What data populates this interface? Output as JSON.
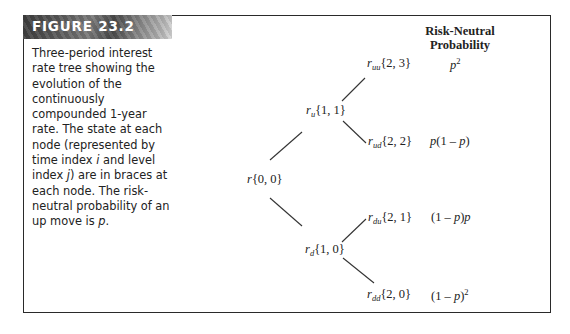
{
  "figure": {
    "label": "FIGURE 23.2",
    "caption_parts": [
      {
        "text": "Three-period interest rate tree showing the evolution of the continuously compounded 1-year rate. The state at each node (represented by time index ",
        "italic": false
      },
      {
        "text": "i",
        "italic": true
      },
      {
        "text": " and level index ",
        "italic": false
      },
      {
        "text": "j",
        "italic": true
      },
      {
        "text": ") are in braces at each node. The risk-neutral probability of an up move is ",
        "italic": false
      },
      {
        "text": "p",
        "italic": true
      },
      {
        "text": ".",
        "italic": false
      }
    ],
    "column_header_line1": "Risk-Neutral",
    "column_header_line2": "Probability"
  },
  "tree": {
    "nodes": [
      {
        "id": "root",
        "symbol": "r",
        "subscript": "",
        "state": "{0, 0}"
      },
      {
        "id": "u",
        "symbol": "r",
        "subscript": "u",
        "state": "{1, 1}"
      },
      {
        "id": "d",
        "symbol": "r",
        "subscript": "d",
        "state": "{1, 0}"
      },
      {
        "id": "uu",
        "symbol": "r",
        "subscript": "uu",
        "state": "{2, 3}"
      },
      {
        "id": "ud",
        "symbol": "r",
        "subscript": "ud",
        "state": "{2, 2}"
      },
      {
        "id": "du",
        "symbol": "r",
        "subscript": "du",
        "state": "{2, 1}"
      },
      {
        "id": "dd",
        "symbol": "r",
        "subscript": "dd",
        "state": "{2, 0}"
      }
    ],
    "edges": [
      [
        "root",
        "u"
      ],
      [
        "root",
        "d"
      ],
      [
        "u",
        "uu"
      ],
      [
        "u",
        "ud"
      ],
      [
        "d",
        "du"
      ],
      [
        "d",
        "dd"
      ]
    ],
    "probabilities": {
      "uu": {
        "base": "p",
        "exp": "2"
      },
      "ud": {
        "pre": "p(1 – ",
        "var": "p",
        "post": ")"
      },
      "du": {
        "pre": "(1 – ",
        "var": "p",
        "post": ")p"
      },
      "dd": {
        "pre": "(1 – ",
        "var": "p",
        "post": ")",
        "exp": "2"
      }
    }
  }
}
